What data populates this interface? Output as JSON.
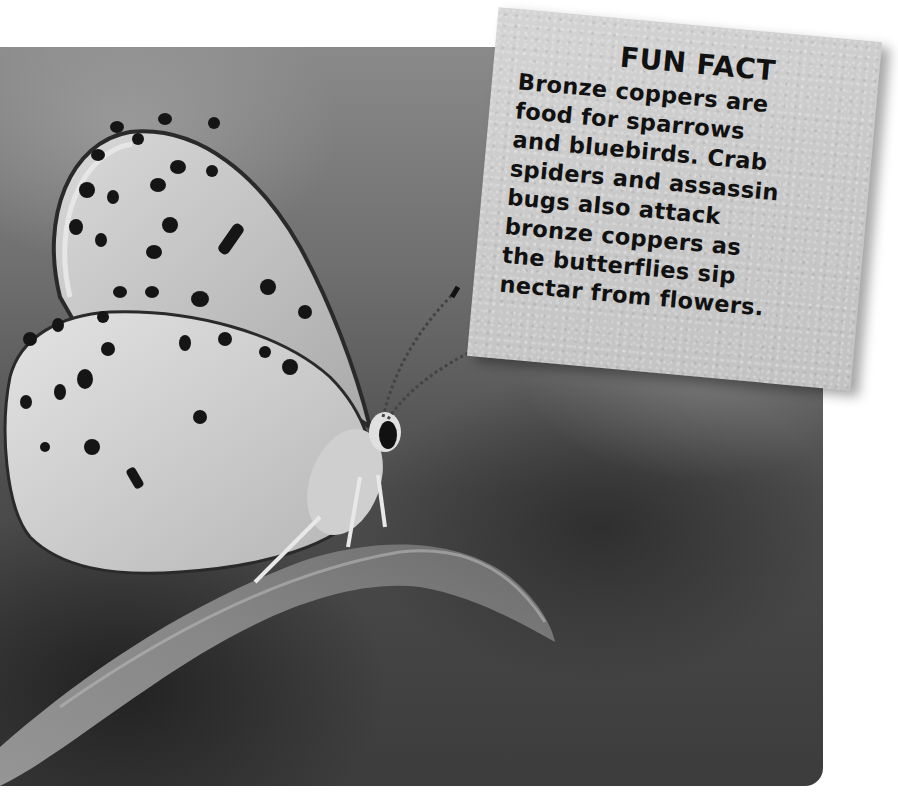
{
  "photo": {
    "subject": "bronze copper butterfly perched on a leaf",
    "style": "grayscale",
    "background_color": "#5a5a5a",
    "corner_radius_px": 18
  },
  "fun_fact": {
    "title": "FUN FACT",
    "lines": [
      "Bronze coppers are",
      "food for sparrows",
      "and bluebirds. Crab",
      "spiders and assassin",
      "bugs also attack",
      "bronze coppers as",
      "the butterflies sip",
      "nectar from flowers."
    ],
    "background_color": "#cacaca",
    "text_color": "#111111",
    "rotation_deg": 5.2
  }
}
